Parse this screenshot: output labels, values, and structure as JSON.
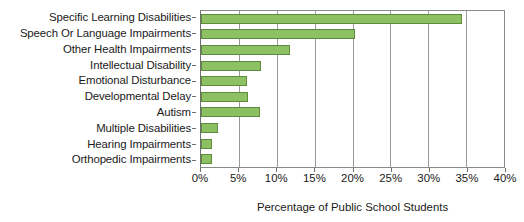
{
  "chart_data": {
    "type": "bar",
    "orientation": "horizontal",
    "title": "",
    "xlabel": "Percentage of Public School Students",
    "ylabel": "",
    "xlim": [
      0,
      40
    ],
    "xtick_labels": [
      "0%",
      "5%",
      "10%",
      "15%",
      "20%",
      "25%",
      "30%",
      "35%",
      "40%"
    ],
    "xticks": [
      0,
      5,
      10,
      15,
      20,
      25,
      30,
      35,
      40
    ],
    "grid": true,
    "legend": "none",
    "bar_color": "#8DC063",
    "bar_edge_color": "#5e8c3a",
    "categories": [
      "Specific Learning Disabilities",
      "Speech Or Language Impairments",
      "Other Health Impairments",
      "Intellectual Disability",
      "Emotional Disturbance",
      "Developmental Delay",
      "Autism",
      "Multiple Disabilities",
      "Hearing Impairments",
      "Orthopedic Impairments"
    ],
    "values": [
      34.5,
      20.3,
      11.7,
      7.9,
      6.1,
      6.2,
      7.8,
      2.2,
      1.4,
      1.4
    ]
  }
}
